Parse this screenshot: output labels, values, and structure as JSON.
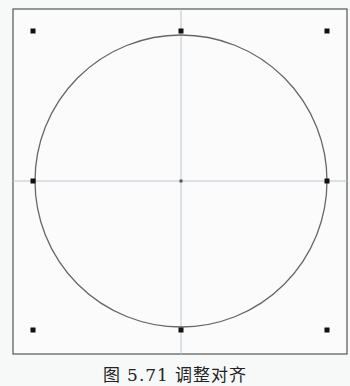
{
  "figure": {
    "caption": "图 5.71   调整对齐",
    "frame": {
      "x": 13,
      "y": 9,
      "w": 334,
      "h": 345,
      "stroke": "#555555"
    },
    "circle": {
      "cx": 181,
      "cy": 181,
      "r": 146,
      "stroke": "#666666"
    },
    "guides": {
      "stroke": "#b9c6d2",
      "h_y": 181,
      "v_x": 181
    },
    "handles": [
      {
        "name": "top-left",
        "x": 33,
        "y": 31
      },
      {
        "name": "top-center",
        "x": 181,
        "y": 31
      },
      {
        "name": "top-right",
        "x": 327,
        "y": 31
      },
      {
        "name": "middle-left",
        "x": 33,
        "y": 181
      },
      {
        "name": "center",
        "x": 181,
        "y": 181
      },
      {
        "name": "middle-right",
        "x": 327,
        "y": 181
      },
      {
        "name": "bottom-left",
        "x": 33,
        "y": 330
      },
      {
        "name": "bottom-center",
        "x": 181,
        "y": 330
      },
      {
        "name": "bottom-right",
        "x": 327,
        "y": 330
      }
    ]
  }
}
